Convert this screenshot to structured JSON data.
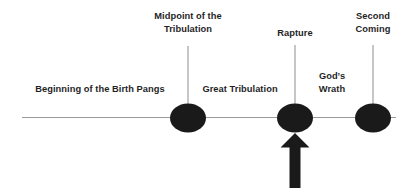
{
  "diagram": {
    "background_color": "#ffffff",
    "axis_color": "#9a9a9a",
    "marker_color": "#1a1a1a",
    "text_color": "#1f1f1f",
    "arrow_color": "#1a1a1a"
  },
  "axis": {
    "label": "timeline"
  },
  "events": [
    {
      "id": "midpoint",
      "label": "Midpoint of the\nTribulation",
      "x": 188,
      "label_y": 10,
      "leader_top": 46,
      "leader_height": 59
    },
    {
      "id": "rapture",
      "label": "Rapture",
      "x": 295,
      "label_y": 27,
      "leader_top": 45,
      "leader_height": 60
    },
    {
      "id": "second-coming",
      "label": "Second\nComing",
      "x": 373,
      "label_y": 10,
      "leader_top": 45,
      "leader_height": 60
    }
  ],
  "periods": [
    {
      "id": "birth-pangs",
      "label": "Beginning of the Birth Pangs",
      "x": 100,
      "y": 83
    },
    {
      "id": "great-tribulation",
      "label": "Great Tribulation",
      "x": 240,
      "y": 83
    },
    {
      "id": "gods-wrath",
      "label": "God’s\nWrath",
      "x": 332,
      "y": 70
    }
  ],
  "arrow": {
    "id": "rapture-emphasis-arrow",
    "points_to": "rapture",
    "x": 295,
    "top": 133,
    "width": 29,
    "height": 55
  }
}
